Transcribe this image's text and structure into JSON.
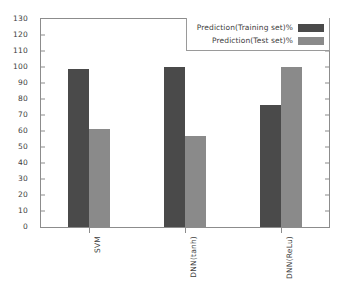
{
  "chart_data": {
    "type": "bar",
    "title": "",
    "xlabel": "",
    "ylabel": "",
    "categories": [
      "SVM",
      "DNN(tanh)",
      "DNN(ReLu)"
    ],
    "series": [
      {
        "name": "Prediction(Training set)%",
        "color": "#4a4a4a",
        "values": [
          99,
          100,
          76
        ]
      },
      {
        "name": "Prediction(Test set)%",
        "color": "#8a8a8a",
        "values": [
          61,
          57,
          100
        ]
      }
    ],
    "ylim": [
      0,
      130
    ],
    "ytick_step": 10,
    "yticks": [
      0,
      10,
      20,
      30,
      40,
      50,
      60,
      70,
      80,
      90,
      100,
      110,
      120,
      130
    ],
    "ytick_labels": [
      "0",
      "10",
      "20",
      "30",
      "40",
      "50",
      "60",
      "70",
      "80",
      "90",
      "100",
      "110",
      "120",
      "130"
    ],
    "grid": false,
    "legend_position": "top-right",
    "xtick_label_rotation": 90
  },
  "colors": {
    "axis": "#8c8c8c",
    "text": "#3d3d3d",
    "background": "#ffffff"
  }
}
